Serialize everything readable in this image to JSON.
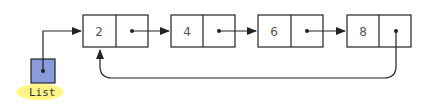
{
  "diagram": {
    "type": "circular-linked-list",
    "pointer": {
      "label": "List",
      "fill": "#8a9bdc",
      "highlight": "#fff47a"
    },
    "nodes": [
      {
        "value": "2"
      },
      {
        "value": "4"
      },
      {
        "value": "6"
      },
      {
        "value": "8"
      }
    ],
    "colors": {
      "stroke": "#222222",
      "text": "#555555"
    }
  }
}
